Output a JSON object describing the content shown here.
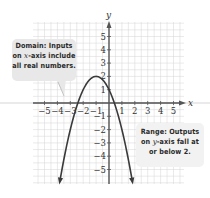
{
  "chart_data": {
    "type": "line",
    "title": "",
    "xlabel": "x",
    "ylabel": "y",
    "xlim": [
      -5.5,
      6.0
    ],
    "ylim": [
      -6.2,
      6.2
    ],
    "grid": true,
    "x_ticks": [
      -5,
      -4,
      -3,
      -2,
      -1,
      1,
      2,
      3,
      4,
      5
    ],
    "y_ticks": [
      -5,
      -4,
      -3,
      -2,
      -1,
      1,
      2,
      3,
      4,
      5
    ],
    "x_tick_labels": [
      "−5",
      "−4",
      "−3",
      "−2",
      "−1",
      "1",
      "2",
      "3",
      "4",
      "5"
    ],
    "y_tick_labels": [
      "−5",
      "−4",
      "−3",
      "−2",
      "−1",
      "1",
      "2",
      "3",
      "4",
      "5"
    ],
    "series": [
      {
        "name": "f(x) = -(x+1)^2 + 2",
        "function": "-(x+1)^2+2",
        "vertex": [
          -1,
          2
        ],
        "y_intercept": [
          0,
          1
        ],
        "x_domain_drawn": [
          -3.8,
          1.8
        ],
        "arrows_at_ends": true,
        "color": "#3a3a3a",
        "points": [
          {
            "x": -3.8,
            "y": -5.84
          },
          {
            "x": -3,
            "y": -2
          },
          {
            "x": -2.41,
            "y": 0
          },
          {
            "x": -2,
            "y": 1
          },
          {
            "x": -1,
            "y": 2
          },
          {
            "x": 0,
            "y": 1
          },
          {
            "x": 0.41,
            "y": 0
          },
          {
            "x": 1,
            "y": -2
          },
          {
            "x": 1.8,
            "y": -5.84
          }
        ]
      }
    ],
    "annotations": [
      {
        "id": "domain",
        "text": "Domain: Inputs on x-axis include all real numbers."
      },
      {
        "id": "range",
        "text": "Range: Outputs on y-axis fall at or below 2."
      }
    ]
  },
  "labels": {
    "x_axis": "x",
    "y_axis": "y",
    "domain": {
      "line1": "Domain: Inputs",
      "line2_pre": "on ",
      "line2_var": "x",
      "line2_post": "-axis include",
      "line3": "all real numbers."
    },
    "range": {
      "line1": "Range: Outputs",
      "line2_pre": "on ",
      "line2_var": "y",
      "line2_post": "-axis fall at",
      "line3": "or below 2."
    }
  },
  "colors": {
    "grid": "#d4d4d4",
    "axis": "#555555",
    "curve": "#3a3a3a",
    "callout_bg": "#e8e8e8",
    "text": "#2a2a2a"
  }
}
